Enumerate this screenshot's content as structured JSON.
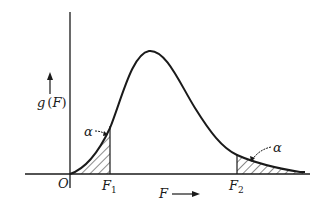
{
  "diagram": {
    "type": "F-distribution density with two-tailed critical regions",
    "labels": {
      "origin": "O",
      "y_axis": "g",
      "y_axis_paren_open": "(",
      "y_axis_var": "F",
      "y_axis_paren_close": ")",
      "x_axis": "F",
      "f1_main": "F",
      "f1_sub": "1",
      "f2_main": "F",
      "f2_sub": "2",
      "alpha_left": "α",
      "alpha_right": "α"
    },
    "colors": {
      "stroke": "#1a1a1a",
      "background": "#ffffff"
    },
    "regions": [
      {
        "name": "left-tail",
        "from": "O",
        "to": "F1",
        "area_label": "α"
      },
      {
        "name": "right-tail",
        "from": "F2",
        "to": "∞",
        "area_label": "α"
      }
    ]
  }
}
